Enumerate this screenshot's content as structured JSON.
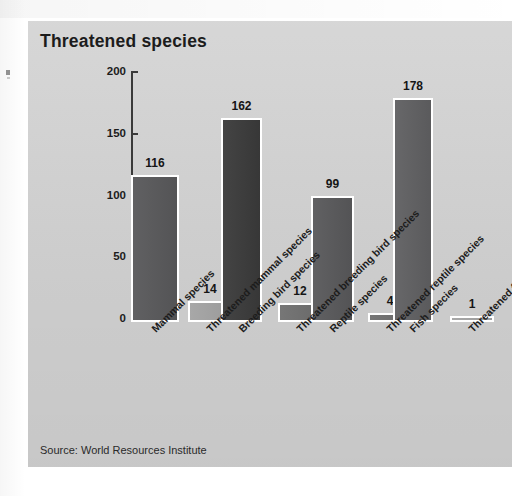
{
  "panel": {
    "title": "Threatened species",
    "source": "Source: World Resources Institute",
    "background_color": "#d2d2d2",
    "border_color": "#ffffff"
  },
  "chart_data": {
    "type": "bar",
    "title": "Threatened species",
    "xlabel": "",
    "ylabel": "",
    "ylim": [
      0,
      200
    ],
    "yticks": [
      0,
      50,
      100,
      150,
      200
    ],
    "grid": false,
    "legend": null,
    "categories": [
      "Mammal species",
      "Threatened mammal species",
      "Breeding bird species",
      "Threatened breeding bird species",
      "Reptile species",
      "Threatened reptile species",
      "Fish species",
      "Threatened fish species"
    ],
    "values": [
      116,
      14,
      162,
      12,
      99,
      4,
      178,
      1
    ],
    "bar_colors": [
      "#58585a",
      "#a3a3a3",
      "#3a3a3a",
      "#6f6f6f",
      "#58585a",
      "#6f6f6f",
      "#5f5f61",
      "#a3a3a3"
    ],
    "bar_border_color": "#ffffff",
    "value_labels": [
      "116",
      "14",
      "162",
      "12",
      "99",
      "4",
      "178",
      "1"
    ],
    "annotations": [
      "Source: World Resources Institute"
    ]
  }
}
